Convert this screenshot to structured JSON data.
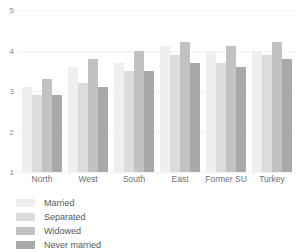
{
  "chart_data": {
    "type": "bar",
    "title": "",
    "subtitle": "",
    "xlabel": "",
    "ylabel": "",
    "categories": [
      "North",
      "West",
      "South",
      "East",
      "Former SU",
      "Turkey"
    ],
    "series": [
      {
        "name": "Married",
        "color": "#f0efed",
        "values": [
          3.1,
          3.6,
          3.7,
          4.1,
          4.0,
          4.0
        ]
      },
      {
        "name": "Separated",
        "color": "#dcdcda",
        "values": [
          2.9,
          3.2,
          3.5,
          3.9,
          3.7,
          3.9
        ]
      },
      {
        "name": "Widowed",
        "color": "#c2c2c0",
        "values": [
          3.3,
          3.8,
          4.0,
          4.2,
          4.1,
          4.2
        ]
      },
      {
        "name": "Never married",
        "color": "#a9aaa8",
        "values": [
          2.9,
          3.1,
          3.5,
          3.7,
          3.6,
          3.8
        ]
      }
    ],
    "ylim": [
      1,
      5
    ],
    "yticks": [
      1,
      2,
      3,
      4,
      5
    ],
    "ytick_labels": [
      "1",
      "2",
      "3",
      "4",
      "5"
    ],
    "grid": true,
    "grid_color": "#e6e4e6",
    "legend_position": "bottom-left",
    "background_color": "#ffffff"
  }
}
